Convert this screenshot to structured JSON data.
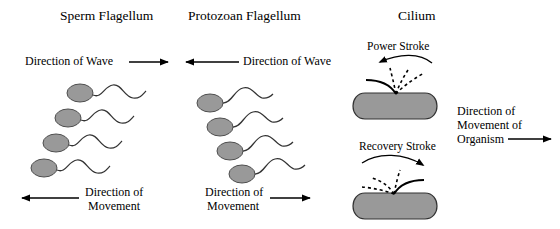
{
  "figure": {
    "background_color": "#ffffff",
    "line_color": "#000000",
    "cell_fill_color": "#999999"
  },
  "panels": [
    {
      "id": "sperm",
      "heading": "Sperm Flagellum",
      "wave_label": "Direction of Wave",
      "wave_arrow_direction": "right",
      "movement_label_line1": "Direction of",
      "movement_label_line2": "Movement",
      "movement_arrow_direction": "left",
      "cell_count": 4
    },
    {
      "id": "protozoan",
      "heading": "Protozoan Flagellum",
      "wave_label": "Direction of Wave",
      "wave_arrow_direction": "left",
      "movement_label_line1": "Direction of",
      "movement_label_line2": "Movement",
      "movement_arrow_direction": "right",
      "cell_count": 4
    },
    {
      "id": "cilium",
      "heading": "Cilium",
      "power_stroke_label": "Power Stroke",
      "power_stroke_arrow_direction": "left",
      "recovery_stroke_label": "Recovery Stroke",
      "recovery_stroke_arrow_direction": "right",
      "organism_label_line1": "Direction of",
      "organism_label_line2": "Movement of",
      "organism_label_line3": "Organism",
      "organism_arrow_direction": "right"
    }
  ]
}
